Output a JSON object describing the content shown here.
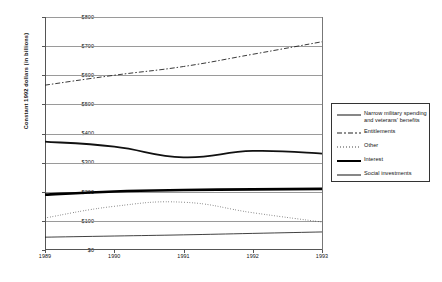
{
  "chart_data": {
    "type": "line",
    "title": "",
    "xlabel": "",
    "ylabel": "Constant 1992 dollars (in billions)",
    "x": [
      1989,
      1990,
      1991,
      1992,
      1993
    ],
    "xticklabels": [
      "1989",
      "1990",
      "1991",
      "1992",
      "1993"
    ],
    "yticklabels": [
      "$0",
      "$100",
      "$200",
      "$300",
      "$400",
      "$500",
      "$600",
      "$700",
      "$800"
    ],
    "yticks": [
      0,
      100,
      200,
      300,
      400,
      500,
      600,
      700,
      800
    ],
    "ylim": [
      0,
      800
    ],
    "xlim": [
      1989,
      1993
    ],
    "grid": "horizontal",
    "legend_position": "right-outside",
    "series": [
      {
        "name": "Narrow military spending and veterans' benefits",
        "style": "solid-thick",
        "color": "#111111",
        "values": [
          372,
          355,
          318,
          340,
          331
        ]
      },
      {
        "name": "Entitlements",
        "style": "dash-dot",
        "color": "#222222",
        "values": [
          566,
          600,
          630,
          672,
          715
        ]
      },
      {
        "name": "Other",
        "style": "dotted",
        "color": "#444444",
        "values": [
          110,
          150,
          164,
          128,
          96
        ]
      },
      {
        "name": "Interest",
        "style": "solid-extra-thick",
        "color": "#000000",
        "values": [
          190,
          201,
          206,
          208,
          210
        ]
      },
      {
        "name": "Social investments",
        "style": "solid-thin",
        "color": "#111111",
        "values": [
          44,
          48,
          52,
          57,
          62
        ]
      }
    ]
  },
  "legend": {
    "entries": [
      {
        "label": "Narrow military spending\nand veterans' benefits",
        "key": "solid-thick"
      },
      {
        "label": "Entitlements",
        "key": "dash-dot"
      },
      {
        "label": "Other",
        "key": "dotted"
      },
      {
        "label": "Interest",
        "key": "solid-extra-thick"
      },
      {
        "label": "Social investments",
        "key": "solid-thin"
      }
    ]
  }
}
